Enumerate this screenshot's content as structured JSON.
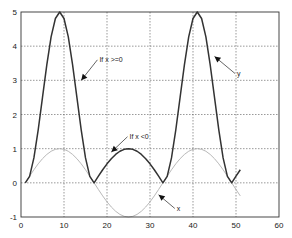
{
  "chart_data": {
    "type": "line",
    "title": "",
    "xlabel": "",
    "ylabel": "",
    "xlim": [
      0,
      60
    ],
    "ylim": [
      -1,
      5
    ],
    "grid": true,
    "xticks": [
      "0",
      "10",
      "20",
      "30",
      "40",
      "50",
      "60"
    ],
    "yticks": [
      "-1",
      "0",
      "1",
      "2",
      "3",
      "4",
      "5"
    ],
    "xtick_values": [
      0,
      10,
      20,
      30,
      40,
      50,
      60
    ],
    "ytick_values": [
      -1,
      0,
      1,
      2,
      3,
      4,
      5
    ],
    "x": [
      1,
      2,
      3,
      4,
      5,
      6,
      7,
      8,
      9,
      10,
      11,
      12,
      13,
      14,
      15,
      16,
      17,
      18,
      19,
      20,
      21,
      22,
      23,
      24,
      25,
      26,
      27,
      28,
      29,
      30,
      31,
      32,
      33,
      34,
      35,
      36,
      37,
      38,
      39,
      40,
      41,
      42,
      43,
      44,
      45,
      46,
      47,
      48,
      49,
      50,
      51
    ],
    "series": [
      {
        "name": "x",
        "color": "#b0b0b0",
        "values": [
          0,
          0.195,
          0.383,
          0.556,
          0.707,
          0.831,
          0.924,
          0.981,
          1,
          0.981,
          0.924,
          0.831,
          0.707,
          0.556,
          0.383,
          0.195,
          0,
          -0.195,
          -0.383,
          -0.556,
          -0.707,
          -0.831,
          -0.924,
          -0.981,
          -1,
          -0.981,
          -0.924,
          -0.831,
          -0.707,
          -0.556,
          -0.383,
          -0.195,
          0,
          0.195,
          0.383,
          0.556,
          0.707,
          0.831,
          0.924,
          0.981,
          1,
          0.981,
          0.924,
          0.831,
          0.707,
          0.556,
          0.383,
          0.195,
          0,
          -0.195,
          -0.383
        ]
      },
      {
        "name": "y",
        "color": "#333333",
        "values": [
          0,
          0.19,
          0.73,
          1.55,
          2.5,
          3.45,
          4.27,
          4.81,
          5,
          4.81,
          4.27,
          3.45,
          2.5,
          1.55,
          0.73,
          0.19,
          0,
          0.195,
          0.383,
          0.556,
          0.707,
          0.831,
          0.924,
          0.981,
          1,
          0.981,
          0.924,
          0.831,
          0.707,
          0.556,
          0.383,
          0.195,
          0,
          0.19,
          0.73,
          1.55,
          2.5,
          3.45,
          4.27,
          4.81,
          5,
          4.81,
          4.27,
          3.45,
          2.5,
          1.55,
          0.73,
          0.19,
          0,
          0.195,
          0.383
        ]
      }
    ],
    "annotations": [
      {
        "text": "If x >=0",
        "point": [
          14,
          3.0
        ],
        "label_at": [
          18,
          3.6
        ]
      },
      {
        "text": "If x <0",
        "point": [
          21,
          0.9
        ],
        "label_at": [
          25,
          1.35
        ]
      },
      {
        "text": "y",
        "point": [
          45,
          3.7
        ],
        "label_at": [
          50,
          3.2
        ]
      },
      {
        "text": "x",
        "point": [
          32,
          -0.35
        ],
        "label_at": [
          36,
          -0.75
        ]
      }
    ]
  }
}
